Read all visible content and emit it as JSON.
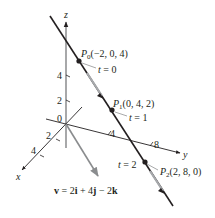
{
  "axes": {
    "x_label": "x",
    "y_label": "y",
    "z_label": "z",
    "origin_label": "0",
    "z_ticks": [
      "2",
      "4"
    ],
    "x_ticks": [
      "2",
      "4"
    ],
    "y_ticks": [
      "4",
      "8"
    ]
  },
  "points": [
    {
      "name": "P",
      "sub": "0",
      "coords": "(−2, 0, 4)",
      "t_label": "t = 0"
    },
    {
      "name": "P",
      "sub": "1",
      "coords": "(0, 4, 2)",
      "t_label": "t = 1"
    },
    {
      "name": "P",
      "sub": "2",
      "coords": "(2, 8, 0)",
      "t_label": "t = 2"
    }
  ],
  "vector": {
    "label_v": "v",
    "label_eq": " = 2",
    "i": "i",
    "plus4": " + 4",
    "j": "j",
    "minus2": " − 2",
    "k": "k"
  },
  "colors": {
    "line": "#231f20",
    "axis": "#4d4d4f",
    "vector": "#8a8c8e",
    "arrow_accent": "#a7a9ac"
  }
}
